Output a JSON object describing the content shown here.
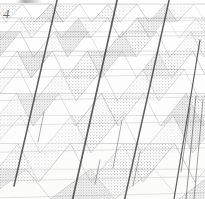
{
  "figure": {
    "label": "4",
    "kind": "micrograph-lattice-diagram",
    "caption_visible": false,
    "background_color": "#fefefe",
    "paper_tone": "#fbfbfa",
    "ink_color": "#555555",
    "shade_color": "#b9b9b9",
    "bold_line_color": "#3a3a3a",
    "thin_line_color": "#8e8e8e"
  },
  "chart_data": {
    "type": "diagram",
    "title": "4",
    "xlabel": "",
    "ylabel": "",
    "grid": true,
    "legend": false,
    "rows": [
      {
        "index": 0,
        "y_top": 8,
        "y_bottom": 22,
        "cells": 9,
        "x_offset": -6,
        "shade_phase": 0
      },
      {
        "index": 1,
        "y_top": 22,
        "y_bottom": 38,
        "cells": 9,
        "x_offset": -10,
        "shade_phase": 1
      },
      {
        "index": 2,
        "y_top": 38,
        "y_bottom": 57,
        "cells": 8,
        "x_offset": -14,
        "shade_phase": 0
      },
      {
        "index": 3,
        "y_top": 57,
        "y_bottom": 78,
        "cells": 8,
        "x_offset": -18,
        "shade_phase": 1
      },
      {
        "index": 4,
        "y_top": 78,
        "y_bottom": 101,
        "cells": 7,
        "x_offset": -22,
        "shade_phase": 0
      },
      {
        "index": 5,
        "y_top": 101,
        "y_bottom": 126,
        "cells": 7,
        "x_offset": -26,
        "shade_phase": 1
      },
      {
        "index": 6,
        "y_top": 126,
        "y_bottom": 153,
        "cells": 6,
        "x_offset": -30,
        "shade_phase": 0
      },
      {
        "index": 7,
        "y_top": 153,
        "y_bottom": 182,
        "cells": 6,
        "x_offset": -34,
        "shade_phase": 1
      },
      {
        "index": 8,
        "y_top": 182,
        "y_bottom": 199,
        "cells": 5,
        "x_offset": -38,
        "shade_phase": 0
      }
    ],
    "bold_traces": [
      {
        "name": "trace-a",
        "x1": 58,
        "y1": -4,
        "x2": 14,
        "y2": 186,
        "width": 1.5
      },
      {
        "name": "trace-b",
        "x1": 118,
        "y1": -4,
        "x2": 72,
        "y2": 202,
        "width": 1.7
      },
      {
        "name": "trace-c",
        "x1": 170,
        "y1": -4,
        "x2": 124,
        "y2": 202,
        "width": 1.5
      },
      {
        "name": "trace-d",
        "x1": 200,
        "y1": 40,
        "x2": 174,
        "y2": 199,
        "width": 1.2
      }
    ],
    "thin_traces": [
      {
        "name": "thin-a",
        "x1": 196,
        "y1": 96,
        "x2": 186,
        "y2": 199,
        "width": 0.8
      },
      {
        "name": "thin-b",
        "x1": 203,
        "y1": 100,
        "x2": 194,
        "y2": 199,
        "width": 0.7
      },
      {
        "name": "thin-c",
        "x1": 190,
        "y1": 108,
        "x2": 181,
        "y2": 172,
        "width": 0.7
      },
      {
        "name": "thin-d",
        "x1": 122,
        "y1": 120,
        "x2": 113,
        "y2": 168,
        "width": 0.6
      },
      {
        "name": "thin-e",
        "x1": 140,
        "y1": 152,
        "x2": 133,
        "y2": 186,
        "width": 0.6
      },
      {
        "name": "thin-f",
        "x1": 100,
        "y1": 160,
        "x2": 95,
        "y2": 184,
        "width": 0.6
      },
      {
        "name": "thin-g",
        "x1": 44,
        "y1": 112,
        "x2": 38,
        "y2": 142,
        "width": 0.6
      }
    ],
    "lattice_direction_families": [
      {
        "name": "near-horizontal-rows",
        "count": 9
      },
      {
        "name": "right-leaning-diagonals",
        "count": 11
      },
      {
        "name": "left-leaning-diagonals",
        "count": 11
      }
    ],
    "perspective": {
      "vanishing_toward": "top",
      "row_height_min": 14,
      "row_height_max": 29,
      "cell_width_min": 22,
      "cell_width_max": 46
    }
  }
}
